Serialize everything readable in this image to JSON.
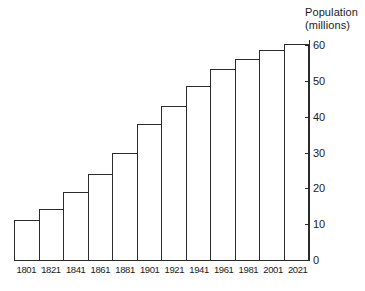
{
  "chart_data": {
    "type": "bar",
    "title": "Population (millions)",
    "title_lines": [
      "Population",
      "(millions)"
    ],
    "xlabel": "",
    "ylabel": "Population (millions)",
    "categories": [
      "1801",
      "1821",
      "1841",
      "1861",
      "1881",
      "1901",
      "1921",
      "1941",
      "1961",
      "1981",
      "2001",
      "2021"
    ],
    "values": [
      11.5,
      14.5,
      19.3,
      24.2,
      30.1,
      38.3,
      43.4,
      48.8,
      53.5,
      56.3,
      59.0,
      60.5
    ],
    "ylim": [
      0,
      62
    ],
    "yticks": [
      0,
      10,
      20,
      30,
      40,
      50,
      60
    ],
    "ytick_labels": [
      "0",
      "10",
      "20",
      "30",
      "40",
      "50",
      "60"
    ],
    "grid": false,
    "legend": false,
    "y_axis_position": "right",
    "bar_fill": "#ffffff",
    "bar_stroke": "#2b2b2b",
    "background": "#ffffff"
  },
  "annotations": {
    "pre_1821_mark": "'"
  }
}
